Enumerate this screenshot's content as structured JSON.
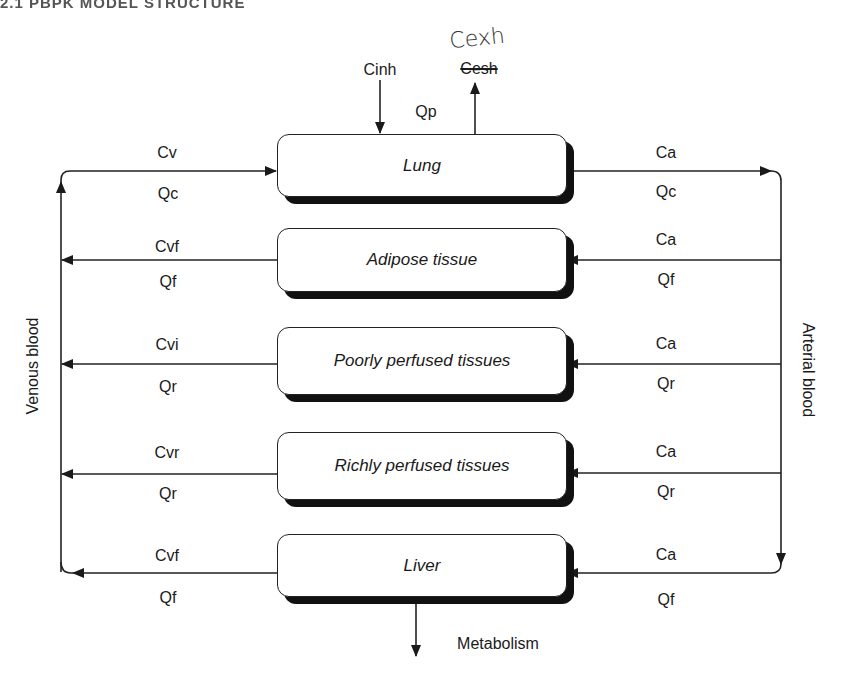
{
  "header": {
    "cropped_text": "2.1        PBPK MODEL STRUCTURE"
  },
  "annotations": {
    "inhaled": "Cinh",
    "pulmonary_flow": "Qp",
    "exhaled_original": "Cesh",
    "exhaled_handwritten": "Cexh",
    "metabolism": "Metabolism"
  },
  "side_labels": {
    "venous": "Venous blood",
    "arterial": "Arterial blood"
  },
  "compartments": [
    {
      "name": "Lung",
      "left_conc": "Cv",
      "left_flow": "Qc",
      "right_conc": "Ca",
      "right_flow": "Qc"
    },
    {
      "name": "Adipose tissue",
      "left_conc": "Cvf",
      "left_flow": "Qf",
      "right_conc": "Ca",
      "right_flow": "Qf"
    },
    {
      "name": "Poorly perfused tissues",
      "left_conc": "Cvi",
      "left_flow": "Qr",
      "right_conc": "Ca",
      "right_flow": "Qr"
    },
    {
      "name": "Richly perfused tissues",
      "left_conc": "Cvr",
      "left_flow": "Qr",
      "right_conc": "Ca",
      "right_flow": "Qr"
    },
    {
      "name": "Liver",
      "left_conc": "Cvf",
      "left_flow": "Qf",
      "right_conc": "Ca",
      "right_flow": "Qf"
    }
  ],
  "colors": {
    "line": "#222222",
    "shadow": "#111111",
    "background": "#ffffff"
  }
}
